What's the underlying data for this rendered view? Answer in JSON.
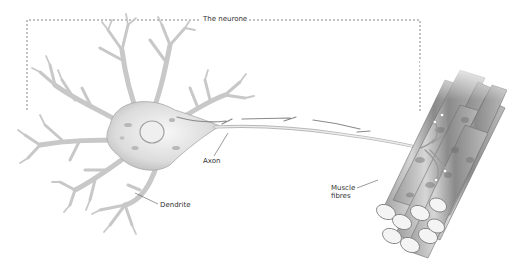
{
  "diagram": {
    "title": "The neurone",
    "labels": {
      "axon": "Axon",
      "dendrite": "Dendrite",
      "muscle_line1": "Muscle",
      "muscle_line2": "fibres"
    },
    "colors": {
      "cell_fill": "#e4e4e4",
      "cell_stroke": "#9a9a9a",
      "muscle_dark": "#7a7a7a",
      "muscle_light": "#d8d8d8",
      "bracket": "#777777",
      "label_text": "#333333"
    }
  }
}
